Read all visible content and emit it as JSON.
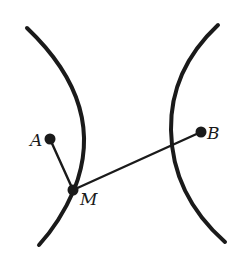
{
  "diagram": {
    "type": "hyperbola-branches",
    "stroke_color": "#1a1a1a",
    "background": "#ffffff",
    "curves": [
      {
        "id": "left-branch",
        "path": "M27,28 Q108,105 74,190 Q60,222 39,245"
      },
      {
        "id": "right-branch",
        "path": "M218,25 Q170,70 171,130 Q172,195 225,242"
      }
    ],
    "points": [
      {
        "id": "A",
        "label": "A",
        "x": 50,
        "y": 139,
        "label_x": 30,
        "label_y": 146
      },
      {
        "id": "M",
        "label": "M",
        "x": 73,
        "y": 190,
        "label_x": 80,
        "label_y": 205
      },
      {
        "id": "B",
        "label": "B",
        "x": 201,
        "y": 132,
        "label_x": 207,
        "label_y": 139
      }
    ],
    "segments": [
      {
        "id": "AM",
        "from": "A",
        "to": "M"
      },
      {
        "id": "MB",
        "from": "M",
        "to": "B"
      }
    ]
  }
}
